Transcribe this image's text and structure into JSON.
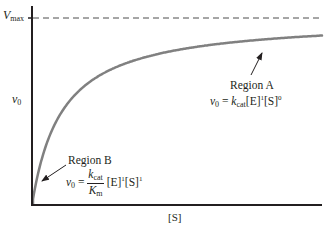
{
  "chart_data": {
    "type": "line",
    "title": "",
    "xlabel": "[S]",
    "ylabel": "v0",
    "y_reference_line": {
      "label": "Vmax",
      "style": "dashed"
    },
    "series": [
      {
        "name": "Michaelis-Menten curve",
        "model": "v0 = Vmax[S]/(Km+[S])",
        "x": [
          0,
          0.5,
          1,
          2,
          3,
          4,
          5,
          6,
          7,
          8,
          9
        ],
        "values": [
          0,
          0.33,
          0.5,
          0.67,
          0.75,
          0.8,
          0.83,
          0.86,
          0.88,
          0.89,
          0.9
        ],
        "color": "#808080"
      }
    ],
    "annotations": [
      {
        "label": "Region A",
        "equation": "v0 = kcat[E]^1[S]^0",
        "points_to": "plateau of curve"
      },
      {
        "label": "Region B",
        "equation": "v0 = (kcat/Km)[E]^1[S]^1",
        "points_to": "initial linear region"
      }
    ],
    "grid": false,
    "legend": "none"
  },
  "axes": {
    "y_label_main": "v",
    "y_label_sub": "0",
    "vmax_main": "V",
    "vmax_sub": "max",
    "x_label": "[S]"
  },
  "region_a": {
    "title": "Region A",
    "v": "v",
    "v_sub": "0",
    "eq": " = ",
    "k": "k",
    "k_sub": "cat",
    "e": "[E]",
    "e_sup": "1",
    "s": "[S]",
    "s_sup": "0"
  },
  "region_b": {
    "title": "Region B",
    "v": "v",
    "v_sub": "0",
    "eq": " = ",
    "num_k": "k",
    "num_sub": "cat",
    "den_k": "K",
    "den_sub": "m",
    "e": "[E]",
    "e_sup": "1",
    "s": "[S]",
    "s_sup": "1"
  },
  "colors": {
    "axis": "#231f20",
    "curve": "#808080",
    "dashed": "#4d4d4d",
    "text": "#231f20"
  }
}
